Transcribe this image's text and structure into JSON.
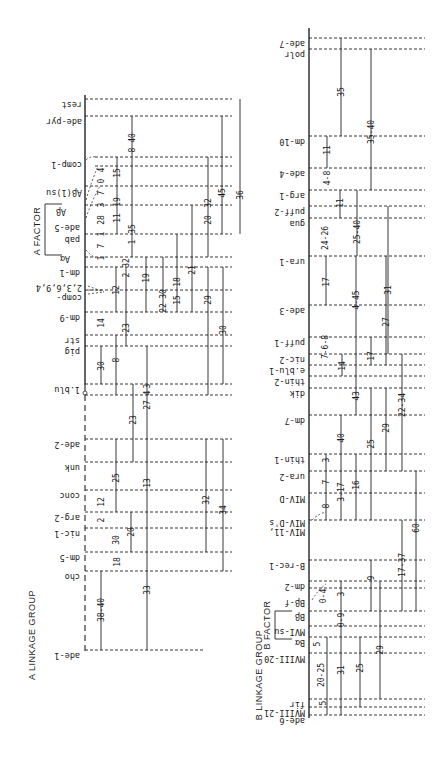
{
  "figure": {
    "orientation": "rotated 180 degrees (scanned page)",
    "ink_color": "#1a1a1a",
    "background": "#ffffff"
  },
  "groupA": {
    "title": "A LINKAGE GROUP",
    "title_marker": "A",
    "factor_label": "A FACTOR",
    "loci": [
      {
        "label": "rest",
        "y": 99
      },
      {
        "label": "ade-pyr",
        "y": 116
      },
      {
        "label": "comp-1",
        "y": 159
      },
      {
        "label": "Aβ(1)su",
        "y": 187
      },
      {
        "label": "Aβ",
        "y": 206
      },
      {
        "label": "ade-5",
        "y": 225
      },
      {
        "label": "pab",
        "y": 234
      },
      {
        "label": "Aα",
        "y": 253
      },
      {
        "label": "dm-1",
        "y": 267
      },
      {
        "label": "2,3,6,9,4",
        "y": 284
      },
      {
        "label": "comp-",
        "y": 291
      },
      {
        "label": "dm-9",
        "y": 312
      },
      {
        "label": "str",
        "y": 335
      },
      {
        "label": "pig",
        "y": 346
      },
      {
        "label": "1.blu",
        "y": 384
      },
      {
        "label": "ade-2",
        "y": 439
      },
      {
        "label": "unk",
        "y": 462
      },
      {
        "label": "conc",
        "y": 490
      },
      {
        "label": "arg-2",
        "y": 512
      },
      {
        "label": "nic-1",
        "y": 528
      },
      {
        "label": "dm-5",
        "y": 552
      },
      {
        "label": "cho",
        "y": 571
      },
      {
        "label": "ade-1",
        "y": 650
      }
    ],
    "distances": [
      "38-40",
      "33",
      "18",
      "30",
      "20",
      "2",
      "12",
      "25",
      "13",
      "23",
      "32",
      "34",
      "27",
      "4",
      "3",
      "30",
      "8",
      "14",
      "23",
      "12",
      "2",
      "32",
      "19",
      "22",
      "30",
      "15",
      "18",
      "21",
      "29",
      "30",
      "1",
      "7",
      "1",
      "28",
      "3",
      "7",
      "0",
      "4",
      "15",
      "11",
      "19",
      "1",
      "35",
      "8",
      "40",
      "20",
      "32",
      "45",
      "36"
    ]
  },
  "groupB": {
    "title": "B LINKAGE GROUP",
    "title_marker": "B",
    "factor_label": "B FACTOR",
    "loci": [
      {
        "label": "ade-7",
        "y": 38
      },
      {
        "label": "polr",
        "y": 49
      },
      {
        "label": "dm-10",
        "y": 136
      },
      {
        "label": "ade-4",
        "y": 168
      },
      {
        "label": "arg-1",
        "y": 190
      },
      {
        "label": "puff-2",
        "y": 206
      },
      {
        "label": "gua",
        "y": 218
      },
      {
        "label": "ura-1",
        "y": 256
      },
      {
        "label": "ade-3",
        "y": 305
      },
      {
        "label": "puff-1",
        "y": 337
      },
      {
        "label": "nic-2",
        "y": 354
      },
      {
        "label": "e.blu-1",
        "y": 365
      },
      {
        "label": "thin-2",
        "y": 376
      },
      {
        "label": "dik",
        "y": 388
      },
      {
        "label": "dm-7",
        "y": 415
      },
      {
        "label": "thin-1",
        "y": 454
      },
      {
        "label": "ura-2",
        "y": 471
      },
      {
        "label": "MIV-D",
        "y": 493
      },
      {
        "label": "MIV-D's",
        "y": 517
      },
      {
        "label": "MIV-11,",
        "y": 525
      },
      {
        "label": "B-rec-1",
        "y": 560
      },
      {
        "label": "dm-2",
        "y": 581
      },
      {
        "label": "Bβ-f",
        "y": 597
      },
      {
        "label": "Bβ",
        "y": 611
      },
      {
        "label": "MVI-su",
        "y": 626
      },
      {
        "label": "Bα",
        "y": 637
      },
      {
        "label": "MVIII-20",
        "y": 653
      },
      {
        "label": "fir",
        "y": 699
      },
      {
        "label": "MVIII-21",
        "y": 707
      },
      {
        "label": "ade-6",
        "y": 715
      }
    ],
    "distances": [
      "35",
      "35-40",
      "11",
      "4-8",
      "11",
      "25-40",
      "24-26",
      "17",
      "4-45",
      "31",
      "27",
      "7-6-8",
      "14",
      "17",
      "43",
      "22-34",
      "29",
      "40",
      "25",
      "3",
      "7",
      "3-17",
      "16",
      "8",
      "60",
      "17-37",
      "9",
      "3",
      "0-4",
      "0-9",
      "5",
      "20-25",
      "31",
      "25",
      "29",
      "5"
    ]
  }
}
